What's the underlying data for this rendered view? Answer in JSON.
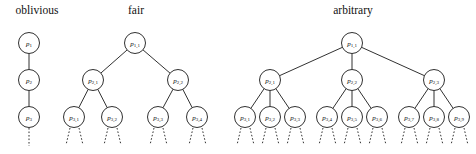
{
  "figure": {
    "caption_present": false,
    "background_color": "#ffffff",
    "ink_color": "#1a1a1a",
    "panels": [
      {
        "id": "oblivious",
        "title": "oblivious",
        "title_x": 37,
        "branching": 1,
        "levels": 3,
        "nodes": [
          {
            "id": "o-n1",
            "label_base": "p",
            "label_sub": "1",
            "x": 29,
            "y": 43,
            "r": 10.5,
            "level": 1
          },
          {
            "id": "o-n2",
            "label_base": "p",
            "label_sub": "2",
            "x": 29,
            "y": 80,
            "r": 10.5,
            "level": 2
          },
          {
            "id": "o-n3",
            "label_base": "p",
            "label_sub": "3",
            "x": 29,
            "y": 117,
            "r": 10.5,
            "level": 3
          }
        ],
        "edges": [
          {
            "from": "o-n1",
            "to": "o-n2"
          },
          {
            "from": "o-n2",
            "to": "o-n3"
          }
        ],
        "stubs": [
          {
            "x1": 29,
            "y1": 128,
            "x2": 29,
            "y2": 146
          }
        ]
      },
      {
        "id": "fair",
        "title": "fair",
        "title_x": 136,
        "branching": 2,
        "levels": 3,
        "nodes": [
          {
            "id": "f-n1",
            "label_base": "p",
            "label_sub": "1,1",
            "x": 135,
            "y": 43,
            "r": 10.5,
            "level": 1
          },
          {
            "id": "f-n2",
            "label_base": "p",
            "label_sub": "2,1",
            "x": 93,
            "y": 80,
            "r": 10.5,
            "level": 2
          },
          {
            "id": "f-n3",
            "label_base": "p",
            "label_sub": "2,2",
            "x": 178,
            "y": 80,
            "r": 10.5,
            "level": 2
          },
          {
            "id": "f-n4",
            "label_base": "p",
            "label_sub": "3,1",
            "x": 74,
            "y": 117,
            "r": 10.5,
            "level": 3
          },
          {
            "id": "f-n5",
            "label_base": "p",
            "label_sub": "3,2",
            "x": 112,
            "y": 117,
            "r": 10.5,
            "level": 3
          },
          {
            "id": "f-n6",
            "label_base": "p",
            "label_sub": "3,3",
            "x": 158,
            "y": 117,
            "r": 10.5,
            "level": 3
          },
          {
            "id": "f-n7",
            "label_base": "p",
            "label_sub": "3,4",
            "x": 197,
            "y": 117,
            "r": 10.5,
            "level": 3
          }
        ],
        "edges": [
          {
            "from": "f-n1",
            "to": "f-n2"
          },
          {
            "from": "f-n1",
            "to": "f-n3"
          },
          {
            "from": "f-n2",
            "to": "f-n4"
          },
          {
            "from": "f-n2",
            "to": "f-n5"
          },
          {
            "from": "f-n3",
            "to": "f-n6"
          },
          {
            "from": "f-n3",
            "to": "f-n7"
          }
        ],
        "stubs": [
          {
            "x1": 70,
            "y1": 128,
            "x2": 66,
            "y2": 145
          },
          {
            "x1": 79,
            "y1": 128,
            "x2": 83,
            "y2": 145
          },
          {
            "x1": 108,
            "y1": 128,
            "x2": 104,
            "y2": 145
          },
          {
            "x1": 117,
            "y1": 128,
            "x2": 121,
            "y2": 145
          },
          {
            "x1": 154,
            "y1": 128,
            "x2": 150,
            "y2": 145
          },
          {
            "x1": 163,
            "y1": 128,
            "x2": 167,
            "y2": 145
          },
          {
            "x1": 193,
            "y1": 128,
            "x2": 189,
            "y2": 145
          },
          {
            "x1": 202,
            "y1": 128,
            "x2": 206,
            "y2": 145
          }
        ]
      },
      {
        "id": "arbitrary",
        "title": "arbitrary",
        "title_x": 353,
        "branching": 3,
        "levels": 3,
        "nodes": [
          {
            "id": "a-n1",
            "label_base": "p",
            "label_sub": "1,1",
            "x": 352,
            "y": 43,
            "r": 10.5,
            "level": 1
          },
          {
            "id": "a-n2",
            "label_base": "p",
            "label_sub": "2,1",
            "x": 270,
            "y": 80,
            "r": 10.5,
            "level": 2
          },
          {
            "id": "a-n3",
            "label_base": "p",
            "label_sub": "2,2",
            "x": 352,
            "y": 80,
            "r": 10.5,
            "level": 2
          },
          {
            "id": "a-n4",
            "label_base": "p",
            "label_sub": "2,3",
            "x": 434,
            "y": 80,
            "r": 10.5,
            "level": 2
          },
          {
            "id": "a-n5",
            "label_base": "p",
            "label_sub": "3,1",
            "x": 245,
            "y": 117,
            "r": 10.5,
            "level": 3
          },
          {
            "id": "a-n6",
            "label_base": "p",
            "label_sub": "3,2",
            "x": 270,
            "y": 117,
            "r": 10.5,
            "level": 3
          },
          {
            "id": "a-n7",
            "label_base": "p",
            "label_sub": "3,3",
            "x": 295,
            "y": 117,
            "r": 10.5,
            "level": 3
          },
          {
            "id": "a-n8",
            "label_base": "p",
            "label_sub": "3,4",
            "x": 327,
            "y": 117,
            "r": 10.5,
            "level": 3
          },
          {
            "id": "a-n9",
            "label_base": "p",
            "label_sub": "3,5",
            "x": 352,
            "y": 117,
            "r": 10.5,
            "level": 3
          },
          {
            "id": "a-n10",
            "label_base": "p",
            "label_sub": "3,6",
            "x": 377,
            "y": 117,
            "r": 10.5,
            "level": 3
          },
          {
            "id": "a-n11",
            "label_base": "p",
            "label_sub": "3,7",
            "x": 409,
            "y": 117,
            "r": 10.5,
            "level": 3
          },
          {
            "id": "a-n12",
            "label_base": "p",
            "label_sub": "3,8",
            "x": 434,
            "y": 117,
            "r": 10.5,
            "level": 3
          },
          {
            "id": "a-n13",
            "label_base": "p",
            "label_sub": "3,9",
            "x": 459,
            "y": 117,
            "r": 10.5,
            "level": 3
          }
        ],
        "edges": [
          {
            "from": "a-n1",
            "to": "a-n2"
          },
          {
            "from": "a-n1",
            "to": "a-n3"
          },
          {
            "from": "a-n1",
            "to": "a-n4"
          },
          {
            "from": "a-n2",
            "to": "a-n5"
          },
          {
            "from": "a-n2",
            "to": "a-n6"
          },
          {
            "from": "a-n2",
            "to": "a-n7"
          },
          {
            "from": "a-n3",
            "to": "a-n8"
          },
          {
            "from": "a-n3",
            "to": "a-n9"
          },
          {
            "from": "a-n3",
            "to": "a-n10"
          },
          {
            "from": "a-n4",
            "to": "a-n11"
          },
          {
            "from": "a-n4",
            "to": "a-n12"
          },
          {
            "from": "a-n4",
            "to": "a-n13"
          }
        ],
        "stubs": [
          {
            "x1": 241,
            "y1": 128,
            "x2": 237,
            "y2": 145
          },
          {
            "x1": 250,
            "y1": 128,
            "x2": 254,
            "y2": 145
          },
          {
            "x1": 266,
            "y1": 128,
            "x2": 262,
            "y2": 145
          },
          {
            "x1": 275,
            "y1": 128,
            "x2": 279,
            "y2": 145
          },
          {
            "x1": 291,
            "y1": 128,
            "x2": 287,
            "y2": 145
          },
          {
            "x1": 300,
            "y1": 128,
            "x2": 304,
            "y2": 145
          },
          {
            "x1": 323,
            "y1": 128,
            "x2": 319,
            "y2": 145
          },
          {
            "x1": 332,
            "y1": 128,
            "x2": 336,
            "y2": 145
          },
          {
            "x1": 348,
            "y1": 128,
            "x2": 344,
            "y2": 145
          },
          {
            "x1": 357,
            "y1": 128,
            "x2": 361,
            "y2": 145
          },
          {
            "x1": 373,
            "y1": 128,
            "x2": 369,
            "y2": 145
          },
          {
            "x1": 382,
            "y1": 128,
            "x2": 386,
            "y2": 145
          },
          {
            "x1": 405,
            "y1": 128,
            "x2": 401,
            "y2": 145
          },
          {
            "x1": 414,
            "y1": 128,
            "x2": 418,
            "y2": 145
          },
          {
            "x1": 430,
            "y1": 128,
            "x2": 426,
            "y2": 145
          },
          {
            "x1": 439,
            "y1": 128,
            "x2": 443,
            "y2": 145
          },
          {
            "x1": 455,
            "y1": 128,
            "x2": 451,
            "y2": 145
          },
          {
            "x1": 464,
            "y1": 128,
            "x2": 468,
            "y2": 145
          }
        ]
      }
    ]
  }
}
